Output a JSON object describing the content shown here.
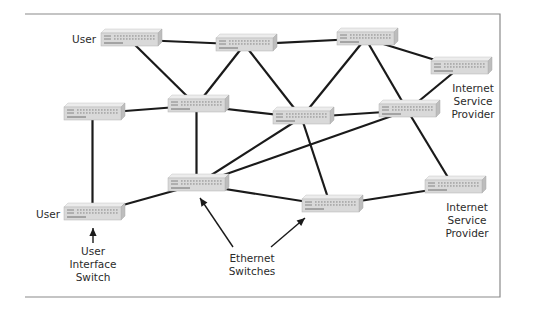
{
  "diagram": {
    "frame": {
      "left": 25,
      "top": 14,
      "right": 500,
      "bottom": 297,
      "color": "#8a8a8a"
    },
    "switch_style": {
      "width": 57,
      "height": 13,
      "depth": 4,
      "face": "#d9d9d9",
      "top": "#ececec",
      "side": "#bdbdbd",
      "port_color": "#9a9a9a"
    },
    "link_color": "#1a1a1a",
    "nodes": [
      {
        "id": "S1",
        "x": 101,
        "y": 33,
        "role": "user"
      },
      {
        "id": "S2",
        "x": 216,
        "y": 38,
        "role": "ethernet"
      },
      {
        "id": "S3",
        "x": 337,
        "y": 32,
        "role": "ethernet"
      },
      {
        "id": "S4",
        "x": 431,
        "y": 61,
        "role": "isp"
      },
      {
        "id": "S5",
        "x": 64,
        "y": 107,
        "role": "ethernet"
      },
      {
        "id": "S6",
        "x": 168,
        "y": 99,
        "role": "ethernet"
      },
      {
        "id": "S7",
        "x": 273,
        "y": 111,
        "role": "ethernet"
      },
      {
        "id": "S8",
        "x": 379,
        "y": 104,
        "role": "ethernet"
      },
      {
        "id": "S9",
        "x": 168,
        "y": 178,
        "role": "ethernet"
      },
      {
        "id": "S10",
        "x": 64,
        "y": 207,
        "role": "user"
      },
      {
        "id": "S11",
        "x": 302,
        "y": 199,
        "role": "ethernet"
      },
      {
        "id": "S12",
        "x": 425,
        "y": 180,
        "role": "isp"
      }
    ],
    "links": [
      [
        "S1",
        "S2"
      ],
      [
        "S1",
        "S6"
      ],
      [
        "S2",
        "S3"
      ],
      [
        "S2",
        "S6"
      ],
      [
        "S2",
        "S7"
      ],
      [
        "S3",
        "S7"
      ],
      [
        "S3",
        "S8"
      ],
      [
        "S3",
        "S4"
      ],
      [
        "S4",
        "S8"
      ],
      [
        "S5",
        "S6"
      ],
      [
        "S5",
        "S10"
      ],
      [
        "S6",
        "S7"
      ],
      [
        "S6",
        "S9"
      ],
      [
        "S7",
        "S8"
      ],
      [
        "S7",
        "S9"
      ],
      [
        "S7",
        "S11"
      ],
      [
        "S8",
        "S9"
      ],
      [
        "S8",
        "S12"
      ],
      [
        "S9",
        "S10"
      ],
      [
        "S9",
        "S11"
      ],
      [
        "S11",
        "S12"
      ]
    ],
    "arrows": [
      {
        "name": "arrow-user-interface-switch",
        "from": [
          93,
          243
        ],
        "to": [
          93,
          228
        ]
      },
      {
        "name": "arrow-ethernet-switches-left",
        "from": [
          233,
          247
        ],
        "to": [
          200,
          198
        ]
      },
      {
        "name": "arrow-ethernet-switches-right",
        "from": [
          271,
          247
        ],
        "to": [
          305,
          218
        ]
      }
    ]
  },
  "labels": {
    "user_top": "User",
    "user_bottom": "User",
    "isp_top": [
      "Internet",
      "Service",
      "Provider"
    ],
    "isp_bottom": [
      "Internet",
      "Service",
      "Provider"
    ],
    "user_interface_switch": [
      "User",
      "Interface",
      "Switch"
    ],
    "ethernet_switches": [
      "Ethernet",
      "Switches"
    ]
  }
}
